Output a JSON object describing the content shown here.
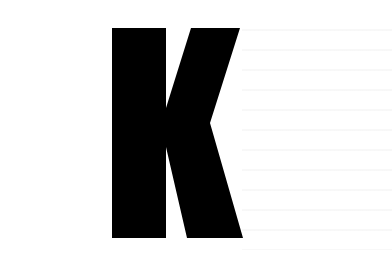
{
  "image": {
    "width": 392,
    "height": 263,
    "background_color": "#ffffff"
  },
  "glyph": {
    "character": "K",
    "color": "#000000",
    "polygon_points": "112,28 166,28 166,108 191,28 240,28 210,123 243,238 187,238 166,147 166,238 112,238"
  }
}
